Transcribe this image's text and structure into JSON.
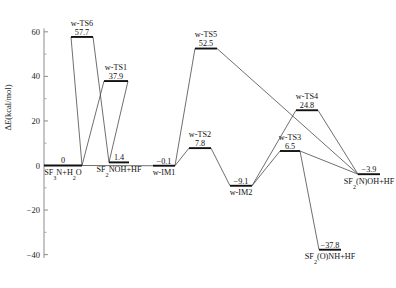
{
  "chart_data": {
    "type": "line",
    "title": "",
    "xlabel": "",
    "ylabel": "ΔE(kcal/mol)",
    "ylim": [
      -42,
      62
    ],
    "grid": false,
    "legend": "none",
    "yticks": [
      60,
      40,
      20,
      0,
      -20,
      -40
    ],
    "ytick_labels": [
      "60",
      "40",
      "20",
      "0",
      "−20",
      "−40"
    ],
    "categories": [
      "SF3N+H2O",
      "w-TS6",
      "w-TS1",
      "SF2NOH+HF",
      "w-IM1",
      "w-TS5",
      "w-TS2",
      "w-IM2",
      "w-TS3",
      "w-TS4",
      "SF2(N)OH+HF",
      "SF2(O)NH+HF"
    ],
    "values": [
      0.0,
      57.7,
      37.9,
      1.4,
      -0.1,
      52.5,
      7.8,
      -9.1,
      6.5,
      24.8,
      -3.9,
      -37.8
    ],
    "points": [
      {
        "id": "sf3n",
        "name": "SF3N+H2O",
        "value": "0",
        "value_num": 0.0,
        "label_pos": "below",
        "name_parts": [
          {
            "t": "SF",
            "s": false
          },
          {
            "t": "3",
            "s": true
          },
          {
            "t": "N+H",
            "s": false
          },
          {
            "t": "2",
            "s": true
          },
          {
            "t": "O",
            "s": false
          }
        ]
      },
      {
        "id": "wts6",
        "name": "w-TS6",
        "value": "57.7",
        "value_num": 57.7,
        "label_pos": "above",
        "name_parts": [
          {
            "t": "w-TS6",
            "s": false
          }
        ]
      },
      {
        "id": "wts1",
        "name": "w-TS1",
        "value": "37.9",
        "value_num": 37.9,
        "label_pos": "above",
        "name_parts": [
          {
            "t": "w-TS1",
            "s": false
          }
        ]
      },
      {
        "id": "sf2noh",
        "name": "SF2NOH+HF",
        "value": "1.4",
        "value_num": 1.4,
        "label_pos": "below",
        "name_parts": [
          {
            "t": "SF",
            "s": false
          },
          {
            "t": "2",
            "s": true
          },
          {
            "t": "NOH+HF",
            "s": false
          }
        ]
      },
      {
        "id": "wim1",
        "name": "w-IM1",
        "value": "−0.1",
        "value_num": -0.1,
        "label_pos": "below",
        "name_parts": [
          {
            "t": "w-IM1",
            "s": false
          }
        ]
      },
      {
        "id": "wts5",
        "name": "w-TS5",
        "value": "52.5",
        "value_num": 52.5,
        "label_pos": "above",
        "name_parts": [
          {
            "t": "w-TS5",
            "s": false
          }
        ]
      },
      {
        "id": "wts2",
        "name": "w-TS2",
        "value": "7.8",
        "value_num": 7.8,
        "label_pos": "above",
        "name_parts": [
          {
            "t": "w-TS2",
            "s": false
          }
        ]
      },
      {
        "id": "wim2",
        "name": "w-IM2",
        "value": "−9.1",
        "value_num": -9.1,
        "label_pos": "below",
        "name_parts": [
          {
            "t": "w-IM2",
            "s": false
          }
        ]
      },
      {
        "id": "wts3",
        "name": "w-TS3",
        "value": "6.5",
        "value_num": 6.5,
        "label_pos": "above",
        "name_parts": [
          {
            "t": "w-TS3",
            "s": false
          }
        ]
      },
      {
        "id": "wts4",
        "name": "w-TS4",
        "value": "24.8",
        "value_num": 24.8,
        "label_pos": "above",
        "name_parts": [
          {
            "t": "w-TS4",
            "s": false
          }
        ]
      },
      {
        "id": "sf2noh2",
        "name": "SF2(N)OH+HF",
        "value": "−3.9",
        "value_num": -3.9,
        "label_pos": "below",
        "name_parts": [
          {
            "t": "SF",
            "s": false
          },
          {
            "t": "2",
            "s": true
          },
          {
            "t": "(N)OH+HF",
            "s": false
          }
        ]
      },
      {
        "id": "sf2onh",
        "name": "SF2(O)NH+HF",
        "value": "−37.8",
        "value_num": -37.8,
        "label_pos": "below",
        "name_parts": [
          {
            "t": "SF",
            "s": false
          },
          {
            "t": "2",
            "s": true
          },
          {
            "t": "(O)NH+HF",
            "s": false
          }
        ]
      }
    ],
    "pathways": [
      [
        "sf3n",
        "wts6",
        "sf2noh"
      ],
      [
        "sf3n",
        "wts1",
        "sf2noh"
      ],
      [
        "sf3n",
        "wim1"
      ],
      [
        "wim1",
        "wts5",
        "sf2noh2"
      ],
      [
        "wim1",
        "wts2",
        "wim2"
      ],
      [
        "wim2",
        "wts3",
        "sf2noh2"
      ],
      [
        "wim2",
        "wts4",
        "sf2noh2"
      ],
      [
        "wts3",
        "sf2onh"
      ]
    ]
  }
}
